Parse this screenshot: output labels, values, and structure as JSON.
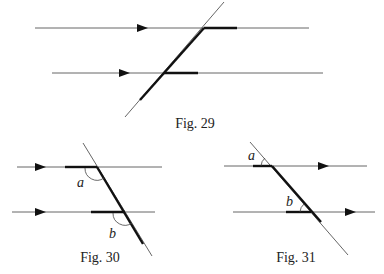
{
  "figures": [
    {
      "id": "fig29",
      "caption": "Fig. 29",
      "caption_pos": [
        195,
        128
      ],
      "lines": [
        {
          "name": "parallel-line-top",
          "x1": 35,
          "y1": 28,
          "x2": 309,
          "y2": 28
        },
        {
          "name": "parallel-line-bottom",
          "x1": 52,
          "y1": 73,
          "x2": 323,
          "y2": 73
        },
        {
          "name": "transversal",
          "x1": 224,
          "y1": 2,
          "x2": 125,
          "y2": 117
        }
      ],
      "thick": [
        {
          "name": "thick-segment-top",
          "x1": 204,
          "y1": 28,
          "x2": 237,
          "y2": 28
        },
        {
          "name": "thick-segment-bottom",
          "x1": 164,
          "y1": 73,
          "x2": 198,
          "y2": 73
        },
        {
          "name": "thick-transversal",
          "x1": 204,
          "y1": 28,
          "x2": 140,
          "y2": 100
        }
      ],
      "arrows": [
        {
          "name": "arrow-top",
          "x": 148,
          "y": 28,
          "dir": "right"
        },
        {
          "name": "arrow-bottom",
          "x": 130,
          "y": 73,
          "dir": "right"
        }
      ],
      "arcs": [],
      "labels": []
    },
    {
      "id": "fig30",
      "caption": "Fig. 30",
      "caption_pos": [
        100,
        262
      ],
      "lines": [
        {
          "name": "parallel-line-top",
          "x1": 17,
          "y1": 167,
          "x2": 162,
          "y2": 167
        },
        {
          "name": "parallel-line-bottom",
          "x1": 12,
          "y1": 212,
          "x2": 155,
          "y2": 212
        },
        {
          "name": "transversal",
          "x1": 83,
          "y1": 143,
          "x2": 152,
          "y2": 256
        }
      ],
      "thick": [
        {
          "name": "thick-segment-top",
          "x1": 65,
          "y1": 167,
          "x2": 97,
          "y2": 167
        },
        {
          "name": "thick-segment-bottom",
          "x1": 91,
          "y1": 212,
          "x2": 125,
          "y2": 212
        },
        {
          "name": "thick-transversal",
          "x1": 97,
          "y1": 167,
          "x2": 143,
          "y2": 244
        }
      ],
      "arrows": [
        {
          "name": "arrow-top",
          "x": 46,
          "y": 167,
          "dir": "right"
        },
        {
          "name": "arrow-bottom",
          "x": 46,
          "y": 212,
          "dir": "right"
        }
      ],
      "arcs": [
        {
          "name": "angle-arc-a",
          "d": "M 85 168 A 12 12 0 0 0 104 178"
        },
        {
          "name": "angle-arc-b",
          "d": "M 113 213 A 12 12 0 0 0 132 223"
        }
      ],
      "labels": [
        {
          "name": "angle-label-a",
          "text": "a",
          "x": 77,
          "y": 187
        },
        {
          "name": "angle-label-b",
          "text": "b",
          "x": 109,
          "y": 238
        }
      ]
    },
    {
      "id": "fig31",
      "caption": "Fig. 31",
      "caption_pos": [
        296,
        262
      ],
      "lines": [
        {
          "name": "parallel-line-top",
          "x1": 224,
          "y1": 166,
          "x2": 367,
          "y2": 166
        },
        {
          "name": "parallel-line-bottom",
          "x1": 233,
          "y1": 212,
          "x2": 375,
          "y2": 212
        },
        {
          "name": "transversal",
          "x1": 250,
          "y1": 142,
          "x2": 348,
          "y2": 255
        }
      ],
      "thick": [
        {
          "name": "thick-segment-top",
          "x1": 253,
          "y1": 166,
          "x2": 272,
          "y2": 166
        },
        {
          "name": "thick-segment-bottom",
          "x1": 286,
          "y1": 212,
          "x2": 311,
          "y2": 212
        },
        {
          "name": "thick-transversal",
          "x1": 272,
          "y1": 166,
          "x2": 321,
          "y2": 222
        }
      ],
      "arrows": [
        {
          "name": "arrow-top",
          "x": 329,
          "y": 166,
          "dir": "right"
        },
        {
          "name": "arrow-bottom",
          "x": 356,
          "y": 212,
          "dir": "right"
        }
      ],
      "arcs": [
        {
          "name": "angle-arc-a",
          "d": "M 261 166 A 11 11 0 0 1 265 158"
        },
        {
          "name": "angle-arc-b",
          "d": "M 300 212 A 11 11 0 0 1 304 204"
        }
      ],
      "labels": [
        {
          "name": "angle-label-a",
          "text": "a",
          "x": 248,
          "y": 160
        },
        {
          "name": "angle-label-b",
          "text": "b",
          "x": 286,
          "y": 206
        }
      ]
    }
  ]
}
